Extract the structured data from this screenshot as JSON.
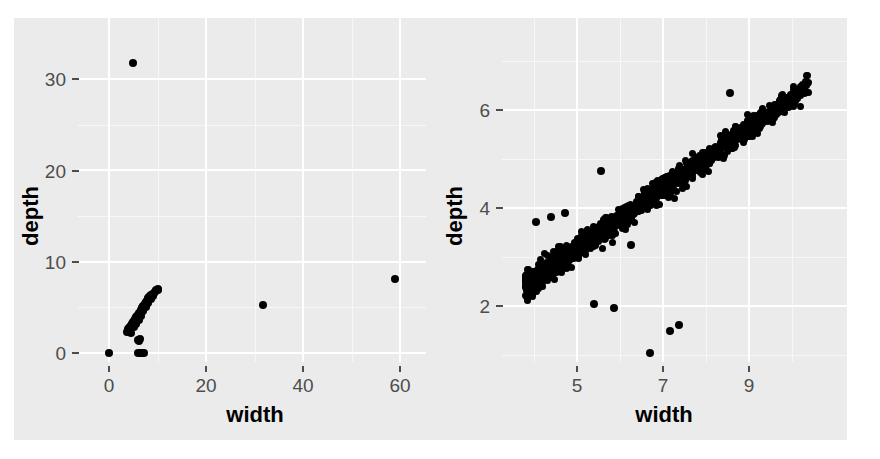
{
  "figure": {
    "background_color": "#ffffff",
    "panel_background_color": "#ebebeb",
    "gridline_color": "#ffffff",
    "minor_gridline_color": "#f7f7f7",
    "point_color": "#000000",
    "axis_text_color": "#4d4d4d",
    "axis_title_color": "#000000"
  },
  "chart_data": [
    {
      "id": "left-panel",
      "type": "scatter",
      "title": "",
      "xlabel": "width",
      "ylabel": "depth",
      "xlim": [
        -4.5,
        64
      ],
      "ylim": [
        -2.0,
        34.5
      ],
      "xticks": [
        0,
        20,
        40,
        60
      ],
      "xticklabels": [
        "0",
        "20",
        "40",
        "60"
      ],
      "yticks": [
        0,
        10,
        20,
        30
      ],
      "yticklabels": [
        "0",
        "10",
        "20",
        "30"
      ],
      "minor_xticks": [
        10,
        30,
        50
      ],
      "minor_yticks": [
        5,
        15,
        25
      ],
      "grid": true,
      "legend": "none",
      "description": "Full-range scatter of diamond depth vs width showing extreme outliers",
      "points": [
        [
          5.0,
          31.8
        ],
        [
          31.8,
          5.3
        ],
        [
          58.9,
          8.1
        ],
        [
          0.0,
          0.0
        ],
        [
          5.9,
          0.0
        ],
        [
          6.3,
          0.0
        ],
        [
          6.5,
          0.0
        ],
        [
          6.8,
          0.0
        ],
        [
          7.2,
          0.0
        ],
        [
          6.0,
          1.4
        ],
        [
          6.4,
          1.5
        ],
        [
          6.2,
          1.3
        ],
        [
          3.7,
          2.3
        ],
        [
          3.9,
          2.4
        ],
        [
          4.0,
          2.4
        ],
        [
          4.1,
          2.5
        ],
        [
          4.2,
          2.5
        ],
        [
          4.3,
          2.6
        ],
        [
          4.0,
          2.6
        ],
        [
          4.2,
          2.7
        ],
        [
          4.3,
          2.7
        ],
        [
          4.4,
          2.8
        ],
        [
          4.5,
          2.8
        ],
        [
          4.6,
          2.9
        ],
        [
          4.4,
          2.9
        ],
        [
          4.5,
          3.0
        ],
        [
          4.6,
          3.0
        ],
        [
          4.7,
          3.0
        ],
        [
          4.8,
          3.1
        ],
        [
          4.9,
          3.1
        ],
        [
          4.7,
          3.2
        ],
        [
          4.8,
          3.2
        ],
        [
          4.9,
          3.2
        ],
        [
          5.0,
          3.3
        ],
        [
          5.1,
          3.3
        ],
        [
          5.2,
          3.3
        ],
        [
          5.0,
          3.4
        ],
        [
          5.1,
          3.4
        ],
        [
          5.2,
          3.5
        ],
        [
          5.3,
          3.5
        ],
        [
          5.4,
          3.5
        ],
        [
          5.5,
          3.6
        ],
        [
          5.3,
          3.6
        ],
        [
          5.4,
          3.7
        ],
        [
          5.5,
          3.7
        ],
        [
          5.6,
          3.7
        ],
        [
          5.7,
          3.8
        ],
        [
          5.8,
          3.8
        ],
        [
          5.6,
          3.9
        ],
        [
          5.7,
          3.9
        ],
        [
          5.8,
          4.0
        ],
        [
          5.9,
          4.0
        ],
        [
          6.0,
          4.0
        ],
        [
          6.1,
          4.1
        ],
        [
          5.9,
          4.1
        ],
        [
          6.0,
          4.2
        ],
        [
          6.1,
          4.2
        ],
        [
          6.2,
          4.2
        ],
        [
          6.3,
          4.3
        ],
        [
          6.4,
          4.3
        ],
        [
          6.2,
          4.4
        ],
        [
          6.3,
          4.4
        ],
        [
          6.4,
          4.4
        ],
        [
          6.5,
          4.5
        ],
        [
          6.6,
          4.5
        ],
        [
          6.7,
          4.6
        ],
        [
          6.5,
          4.6
        ],
        [
          6.6,
          4.6
        ],
        [
          6.7,
          4.7
        ],
        [
          6.8,
          4.7
        ],
        [
          6.9,
          4.8
        ],
        [
          7.0,
          4.8
        ],
        [
          6.8,
          4.9
        ],
        [
          6.9,
          4.9
        ],
        [
          7.0,
          4.9
        ],
        [
          7.1,
          5.0
        ],
        [
          7.2,
          5.0
        ],
        [
          7.3,
          5.1
        ],
        [
          7.1,
          5.1
        ],
        [
          7.2,
          5.2
        ],
        [
          7.3,
          5.2
        ],
        [
          7.4,
          5.2
        ],
        [
          7.5,
          5.3
        ],
        [
          7.6,
          5.3
        ],
        [
          7.4,
          5.4
        ],
        [
          7.5,
          5.4
        ],
        [
          7.6,
          5.5
        ],
        [
          7.7,
          5.5
        ],
        [
          7.8,
          5.5
        ],
        [
          7.9,
          5.6
        ],
        [
          7.7,
          5.6
        ],
        [
          7.8,
          5.7
        ],
        [
          7.9,
          5.7
        ],
        [
          8.0,
          5.8
        ],
        [
          8.1,
          5.8
        ],
        [
          8.2,
          5.9
        ],
        [
          8.0,
          5.9
        ],
        [
          8.1,
          6.0
        ],
        [
          8.2,
          6.0
        ],
        [
          8.3,
          6.1
        ],
        [
          8.4,
          6.1
        ],
        [
          8.5,
          6.2
        ],
        [
          8.6,
          6.3
        ],
        [
          8.8,
          6.4
        ],
        [
          9.0,
          6.5
        ],
        [
          9.2,
          6.6
        ],
        [
          9.4,
          6.7
        ],
        [
          9.6,
          6.9
        ],
        [
          10.0,
          6.9
        ],
        [
          10.2,
          7.0
        ],
        [
          4.5,
          2.2
        ],
        [
          5.1,
          2.9
        ],
        [
          5.6,
          3.2
        ],
        [
          6.1,
          3.6
        ],
        [
          6.6,
          4.1
        ],
        [
          7.1,
          4.6
        ],
        [
          7.6,
          5.0
        ],
        [
          8.1,
          5.5
        ],
        [
          8.6,
          5.9
        ],
        [
          9.1,
          6.2
        ]
      ]
    },
    {
      "id": "right-panel",
      "type": "scatter",
      "title": "",
      "xlabel": "width",
      "ylabel": "depth",
      "xlim": [
        3.0,
        11.3
      ],
      "ylim": [
        0.55,
        7.5
      ],
      "xticks": [
        5,
        7,
        9
      ],
      "xticklabels": [
        "5",
        "7",
        "9"
      ],
      "yticks": [
        2,
        4,
        6
      ],
      "yticklabels": [
        "2",
        "4",
        "6"
      ],
      "minor_xticks": [
        4,
        6,
        8,
        10
      ],
      "minor_yticks": [
        1,
        3,
        5,
        7
      ],
      "grid": true,
      "legend": "none",
      "description": "Zoomed scatter of diamond depth vs width, strong positive linear relationship with a few low outliers",
      "outliers": [
        [
          6.7,
          1.05
        ],
        [
          7.17,
          1.5
        ],
        [
          7.37,
          1.62
        ],
        [
          5.55,
          4.75
        ],
        [
          4.4,
          3.82
        ],
        [
          4.72,
          3.9
        ],
        [
          4.05,
          3.72
        ],
        [
          6.25,
          3.25
        ],
        [
          5.4,
          2.05
        ],
        [
          5.85,
          1.95
        ],
        [
          8.55,
          6.35
        ]
      ],
      "points_count": 1200
    }
  ],
  "panels": {
    "left": {
      "x_axis_title": "width",
      "y_axis_title": "depth",
      "x_tick_labels": [
        "0",
        "20",
        "40",
        "60"
      ],
      "y_tick_labels": [
        "0",
        "10",
        "20",
        "30"
      ]
    },
    "right": {
      "x_axis_title": "width",
      "y_axis_title": "depth",
      "x_tick_labels": [
        "5",
        "7",
        "9"
      ],
      "y_tick_labels": [
        "2",
        "4",
        "6"
      ]
    }
  }
}
